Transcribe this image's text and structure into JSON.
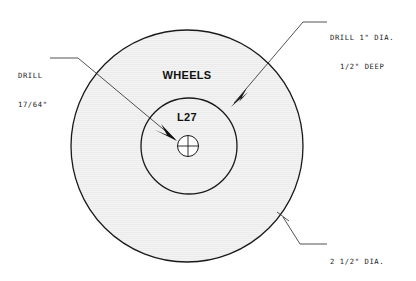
{
  "drawing": {
    "type": "mechanical-part-drawing",
    "part_title": "WHEELS",
    "part_number": "L27",
    "background_color": "#ffffff",
    "line_color": "#1a1a1a",
    "fill_color": "#f2f2f2",
    "annotations": [
      {
        "id": "drill-small",
        "line1": "DRILL",
        "line2": "17/64\"",
        "points_to": "center-hole"
      },
      {
        "id": "drill-counterbore",
        "line1": "DRILL 1\" DIA.",
        "line2": "1/2\" DEEP",
        "points_to": "inner-circle"
      },
      {
        "id": "outer-diameter",
        "line1": "2 1/2\" DIA.",
        "line2": "",
        "points_to": "outer-circle"
      }
    ],
    "geometry": {
      "outer_circle": {
        "cx": 187,
        "cy": 146,
        "r": 116,
        "label": "2 1/2\" DIA."
      },
      "inner_circle": {
        "cx": 189,
        "cy": 146,
        "r": 48,
        "label": "DRILL 1\" DIA. 1/2\" DEEP"
      },
      "center_hole": {
        "cx": 188,
        "cy": 146,
        "r": 10,
        "label": "DRILL 17/64\""
      }
    }
  }
}
